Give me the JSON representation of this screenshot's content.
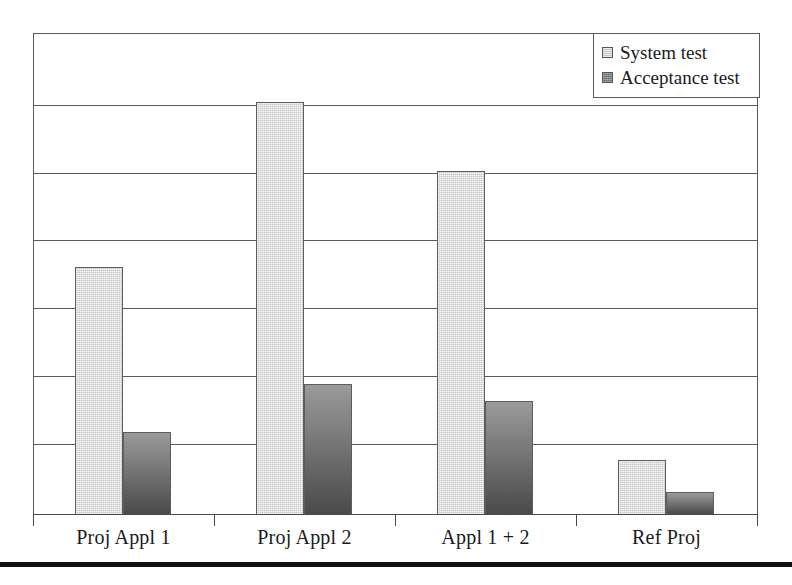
{
  "chart_data": {
    "type": "bar",
    "title": "",
    "xlabel": "",
    "ylabel": "",
    "categories": [
      "Proj Appl 1",
      "Proj Appl 2",
      "Appl 1 + 2",
      "Ref Proj"
    ],
    "series": [
      {
        "name": "System test",
        "color": "#c9c9c9",
        "values": [
          3.6,
          6.0,
          5.0,
          0.8
        ]
      },
      {
        "name": "Acceptance test",
        "color": "#6f6f6f",
        "values": [
          1.2,
          1.9,
          1.65,
          0.33
        ]
      }
    ],
    "ylim": [
      0,
      7
    ],
    "y_tick_labels": [],
    "gridlines": 7,
    "grid": true,
    "legend_position": "top-right",
    "annotations": []
  },
  "legend": {
    "items": [
      {
        "label": "System test",
        "swatch": "legend-swatch-light-gray"
      },
      {
        "label": "Acceptance test",
        "swatch": "legend-swatch-dark-gray"
      }
    ]
  },
  "axis": {
    "categories": [
      "Proj Appl 1",
      "Proj Appl 2",
      "Appl 1 + 2",
      "Ref Proj"
    ]
  },
  "colors": {
    "system_test": "#c9c9c9",
    "acceptance_test": "#6f6f6f",
    "frame": "#5b5b5b",
    "axis": "#4a4a4a",
    "rule": "#121212",
    "background": "#ffffff"
  }
}
